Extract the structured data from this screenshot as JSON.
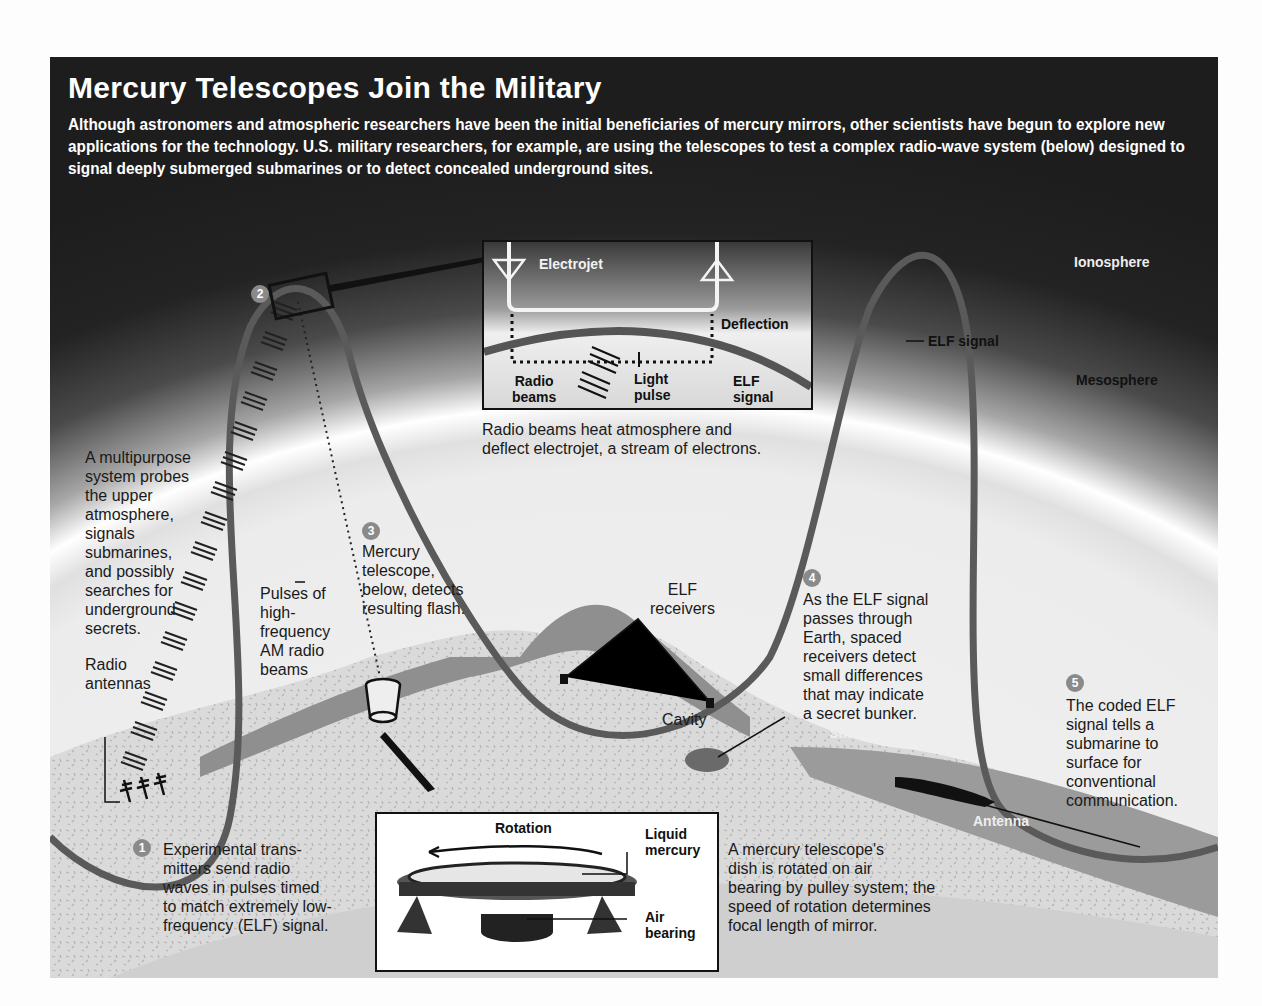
{
  "header": {
    "title": "Mercury Telescopes Join the Military",
    "intro": "Although astronomers and atmospheric researchers have been the initial beneficiaries of mercury mirrors, other scientists have begun to explore new applications for the technology. U.S. military researchers, for example, are using the telescopes to test a complex radio-wave system (below) designed to signal deeply submerged submarines or to detect concealed underground sites."
  },
  "layers": {
    "ionosphere": "Ionosphere",
    "mesosphere": "Mesosphere",
    "elf_signal": "ELF signal"
  },
  "electrojet_inset": {
    "electrojet": "Electrojet",
    "deflection": "Deflection",
    "radio_beams": "Radio\nbeams",
    "light_pulse": "Light\npulse",
    "elf_signal": "ELF\nsignal",
    "caption": "Radio beams heat atmosphere and\ndeflect electrojet, a stream of electrons."
  },
  "labels": {
    "multipurpose": "A multipurpose\nsystem probes\nthe upper\natmosphere,\nsignals\nsubmarines,\nand possibly\nsearches for\nunderground\nsecrets.",
    "pulses": "Pulses of\nhigh-\nfrequency\nAM radio\nbeams",
    "radio_antennas": "Radio\nantennas",
    "elf_receivers": "ELF\nreceivers",
    "cavity": "Cavity",
    "submarine": "Submarine",
    "antenna": "Antenna"
  },
  "steps": [
    {
      "number": "1",
      "text": "Experimental trans-\nmitters send radio\nwaves in pulses timed\nto match extremely low-\nfrequency (ELF) signal."
    },
    {
      "number": "2",
      "text": ""
    },
    {
      "number": "3",
      "text": "Mercury\ntelescope,\nbelow, detects\nresulting flash."
    },
    {
      "number": "4",
      "text": "As the ELF signal\npasses through\nEarth, spaced\nreceivers detect\nsmall differences\nthat may indicate\na secret bunker."
    },
    {
      "number": "5",
      "text": "The coded ELF\nsignal tells a\nsubmarine to\nsurface for\nconventional\ncommunication."
    }
  ],
  "telescope_inset": {
    "rotation": "Rotation",
    "liquid_mercury": "Liquid\nmercury",
    "air_bearing": "Air\nbearing",
    "caption": "A mercury telescope's\ndish is rotated on air\nbearing by pulley system; the\nspeed of rotation determines\nfocal length of mirror."
  },
  "colors": {
    "signal": "#5a5a5a",
    "sky_dark": "#1d1d1d",
    "ground": "#d4d4d4",
    "mountain": "#8f8f8f"
  }
}
